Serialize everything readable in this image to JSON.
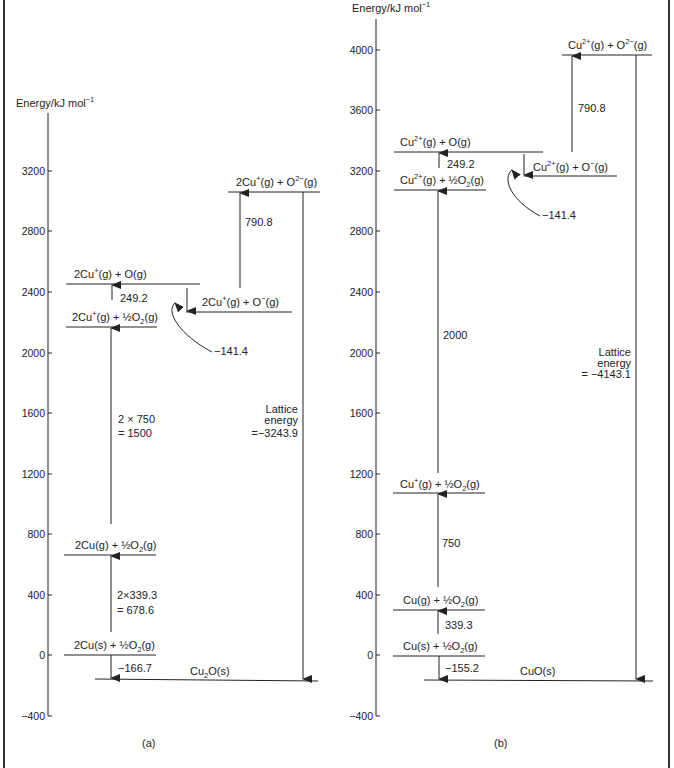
{
  "figure": {
    "panels": [
      {
        "id": "a",
        "caption": "(a)",
        "axis_label": "Energy/kJ mol",
        "axis_label_sup": "−1",
        "ticks": [
          "3200",
          "2800",
          "2400",
          "2000",
          "1600",
          "1200",
          "800",
          "400",
          "0",
          "−400"
        ],
        "levels": {
          "cu2o_o2minus": {
            "main": "2Cu",
            "sup1": "+",
            "rest1": "(g) + O",
            "sup2": "2−",
            "rest2": "(g)"
          },
          "cu_o": {
            "main": "2Cu",
            "sup1": "+",
            "rest1": "(g) + O(g)"
          },
          "cu_ominus": {
            "main": "2Cu",
            "sup1": "+",
            "rest1": "(g) + O",
            "sup2": "−",
            "rest2": "(g)"
          },
          "cuion_halfo2": {
            "main": "2Cu",
            "sup1": "+",
            "rest1": "(g) + ½O",
            "sub": "2",
            "rest2": "(g)"
          },
          "cug_halfo2": {
            "main": "2Cu(g) + ½O",
            "sub": "2",
            "rest2": "(g)"
          },
          "cus_halfo2": {
            "main": "2Cu(s) + ½O",
            "sub": "2",
            "rest2": "(g)"
          },
          "product": {
            "main": "Cu",
            "sub": "2",
            "rest2": "O(s)"
          }
        },
        "steps": {
          "atomisation_o": "249.2",
          "electron_affinity_1": "−141.4",
          "electron_affinity_2": "790.8",
          "ionisation_line1": "2 × 750",
          "ionisation_line2": "= 1500",
          "atomisation_cu_line1": "2×339.3",
          "atomisation_cu_line2": "= 678.6",
          "formation": "−166.7",
          "lattice_line1": "Lattice",
          "lattice_line2": "energy",
          "lattice_line3": "=−3243.9"
        }
      },
      {
        "id": "b",
        "caption": "(b)",
        "axis_label": "Energy/kJ mol",
        "axis_label_sup": "−1",
        "ticks": [
          "4000",
          "3600",
          "3200",
          "2800",
          "2400",
          "2000",
          "1600",
          "1200",
          "800",
          "400",
          "0",
          "−400"
        ],
        "levels": {
          "cu2plus_o2minus": {
            "main": "Cu",
            "sup1": "2+",
            "rest1": "(g) + O",
            "sup2": "2−",
            "rest2": "(g)"
          },
          "cu2plus_o": {
            "main": "Cu",
            "sup1": "2+",
            "rest1": "(g) + O(g)"
          },
          "cu2plus_ominus": {
            "main": "Cu",
            "sup1": "2+",
            "rest1": "(g) + O",
            "sup2": "−",
            "rest2": "(g)"
          },
          "cu2plus_halfo2": {
            "main": "Cu",
            "sup1": "2+",
            "rest1": "(g) + ½O",
            "sub": "2",
            "rest2": "(g)"
          },
          "cuplus_halfo2": {
            "main": "Cu",
            "sup1": "+",
            "rest1": "(g) + ½O",
            "sub": "2",
            "rest2": "(g)"
          },
          "cug_halfo2": {
            "main": "Cu(g) + ½O",
            "sub": "2",
            "rest2": "(g)"
          },
          "cus_halfo2": {
            "main": "Cu(s) + ½O",
            "sub": "2",
            "rest2": "(g)"
          },
          "product": {
            "main": "CuO(s)"
          }
        },
        "steps": {
          "atomisation_o": "249.2",
          "electron_affinity_1": "−141.4",
          "electron_affinity_2": "790.8",
          "ionisation_2": "2000",
          "ionisation_1": "750",
          "atomisation_cu": "339.3",
          "formation": "−155.2",
          "lattice_line1": "Lattice",
          "lattice_line2": "energy",
          "lattice_line3": "= −4143.1"
        }
      }
    ]
  }
}
